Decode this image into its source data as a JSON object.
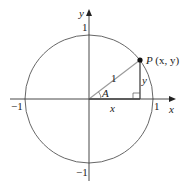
{
  "diagram": {
    "center": [
      89,
      99
    ],
    "radius": 64,
    "colors": {
      "circle": "#555555",
      "axes": "#333333",
      "radius_line": "#9a9a9a",
      "leg_lines": "#444444",
      "point": "#111111"
    },
    "axis_labels": {
      "x": "x",
      "y": "y"
    },
    "tick_labels": {
      "x_pos": "1",
      "x_neg": "−1",
      "y_pos": "1",
      "y_neg": "−1"
    },
    "point": {
      "name": "P",
      "coords": "(x, y)",
      "position": [
        140,
        60
      ]
    },
    "segment_labels": {
      "hypotenuse": "1",
      "adjacent": "x",
      "opposite": "y",
      "angle": "A"
    },
    "right_angle_marker": true
  }
}
